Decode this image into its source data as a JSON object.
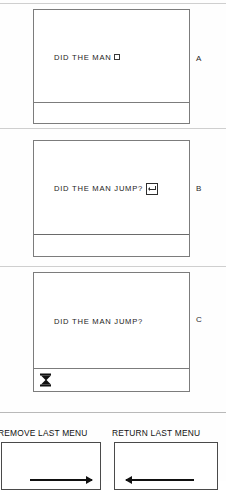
{
  "figure": {
    "panels": [
      {
        "letter": "A",
        "text": "DID THE MAN",
        "cursor_icon": "block-cursor-icon",
        "has_cursor": true,
        "has_return_key": false,
        "status_icon": null
      },
      {
        "letter": "B",
        "text": "DID THE MAN JUMP?",
        "cursor_icon": null,
        "has_cursor": false,
        "has_return_key": true,
        "return_key_icon": "return-arrow-icon",
        "status_icon": null
      },
      {
        "letter": "C",
        "text": "DID THE MAN JUMP?",
        "cursor_icon": null,
        "has_cursor": false,
        "has_return_key": false,
        "status_icon": "hourglass-icon"
      }
    ],
    "menu_actions": [
      {
        "title": "REMOVE LAST MENU",
        "arrow_icon": "arrow-right-icon",
        "direction": "right"
      },
      {
        "title": "RETURN LAST MENU",
        "arrow_icon": "arrow-left-icon",
        "direction": "left"
      }
    ]
  },
  "colors": {
    "ink": "#111111",
    "border": "#7c7c7c",
    "paper": "#fefefe"
  }
}
